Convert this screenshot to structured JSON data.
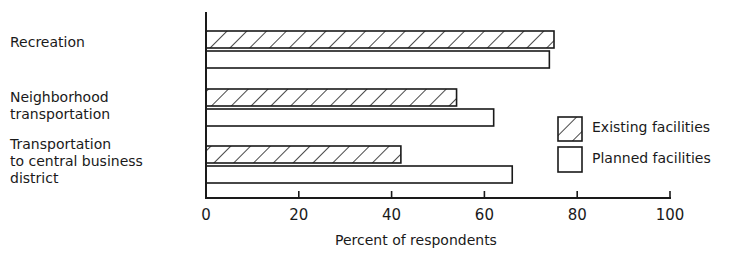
{
  "chart_data": {
    "type": "bar",
    "orientation": "horizontal",
    "categories": [
      "Recreation",
      "Neighborhood\ntransportation",
      "Transportation\nto central business\ndistrict"
    ],
    "series": [
      {
        "name": "Existing facilities",
        "pattern": "hatched",
        "values": [
          75,
          54,
          42
        ]
      },
      {
        "name": "Planned facilities",
        "pattern": "empty",
        "values": [
          74,
          62,
          66
        ]
      }
    ],
    "title": "",
    "xlabel": "Percent of respondents",
    "ylabel": "",
    "xlim": [
      0,
      100
    ],
    "xticks": [
      "0",
      "20",
      "40",
      "60",
      "80",
      "100"
    ],
    "grid": false,
    "legend_position": "right"
  },
  "legend": {
    "existing": "Existing facilities",
    "planned": "Planned facilities"
  },
  "colors": {
    "ink": "#1a1a1a",
    "background": "#ffffff"
  }
}
